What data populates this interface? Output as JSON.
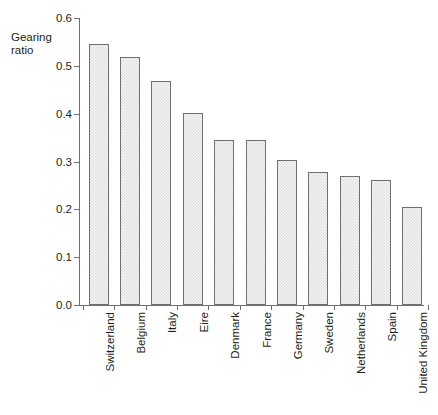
{
  "chart_data": {
    "type": "bar",
    "title": "",
    "subtitle": "",
    "xlabel": "",
    "ylabel": "Gearing\nratio",
    "ylim": [
      0.0,
      0.6
    ],
    "ytick_labels": [
      "0.0",
      "0.1",
      "0.2",
      "0.3",
      "0.4",
      "0.5",
      "0.6"
    ],
    "ytick_values": [
      0.0,
      0.1,
      0.2,
      0.3,
      0.4,
      0.5,
      0.6
    ],
    "grid": false,
    "legend": "none",
    "categories": [
      "Switzerland",
      "Belgium",
      "Italy",
      "Eire",
      "Denmark",
      "France",
      "Germany",
      "Sweden",
      "Netherlands",
      "Spain",
      "United Kingdom"
    ],
    "values": [
      0.545,
      0.519,
      0.469,
      0.402,
      0.345,
      0.345,
      0.303,
      0.278,
      0.27,
      0.262,
      0.205
    ],
    "bar_fill": "#f4f4f4",
    "bar_pattern": "#dcdcdc",
    "bar_edge": "#6f6f6f",
    "axis_color": "#6f6f6f",
    "text_color": "#231f20",
    "background": "#ffffff"
  }
}
